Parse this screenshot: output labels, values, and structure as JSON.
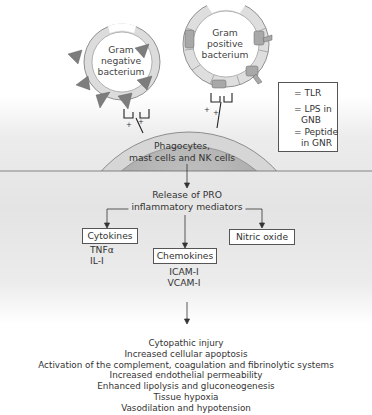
{
  "bacteria": {
    "gram_negative": {
      "line1": "Gram",
      "line2": "negative",
      "line3": "bacterium"
    },
    "gram_positive": {
      "line1": "Gram",
      "line2": "positive",
      "line3": "bacterium"
    },
    "charge_symbol": "+"
  },
  "host_cell": {
    "line1": "Phagocytes,",
    "line2": "mast cells and NK cells"
  },
  "legend": {
    "items": [
      {
        "icon": "tlr-receptor-icon",
        "label": "= TLR"
      },
      {
        "icon": "lps-triangle-icon",
        "label": "= LPS in",
        "label2": "GNB"
      },
      {
        "icon": "peptide-blob-icon",
        "label": "= Peptide",
        "label2": "in GNR"
      }
    ]
  },
  "release": {
    "line1": "Release of PRO",
    "line2": "inflammatory mediators"
  },
  "mediators": {
    "cytokines": {
      "title": "Cytokines",
      "items": [
        "TNFα",
        "IL-I"
      ]
    },
    "chemokines": {
      "title": "Chemokines",
      "items": [
        "ICAM-I",
        "VCAM-I"
      ]
    },
    "nitric_oxide": {
      "title": "Nitric oxide"
    }
  },
  "outcomes": [
    "Cytopathic injury",
    "Increased cellular apoptosis",
    "Activation of the complement, coagulation and fibrinolytic systems",
    "Increased endothelial permeability",
    "Enhanced lipolysis and gluconeogenesis",
    "Tissue hypoxia",
    "Vasodilation and hypotension"
  ],
  "colors": {
    "ring_light": "#dcdcdc",
    "lps_dark": "#7a7a7a",
    "cell_outer": "#d4d4d4",
    "cell_inner": "#a9a9a9",
    "line": "#333333",
    "background_band": "#e6e6e6"
  }
}
